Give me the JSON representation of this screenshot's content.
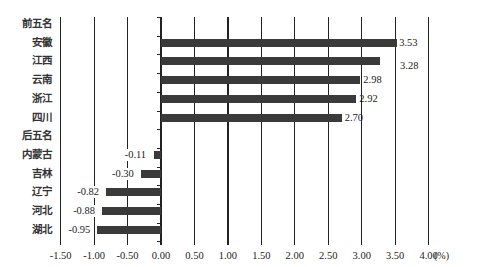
{
  "chart_data": {
    "type": "bar",
    "orientation": "horizontal",
    "title": "",
    "xlabel": "",
    "x_unit": "(%)",
    "ylabel": "",
    "xlim": [
      -1.5,
      4.0
    ],
    "xticks": [
      "-1.50",
      "-1.00",
      "-0.50",
      "0.00",
      "0.50",
      "1.00",
      "1.50",
      "2.00",
      "2.50",
      "3.00",
      "3.50",
      "4.00"
    ],
    "grid": "vertical",
    "legend": null,
    "groups": [
      {
        "name": "前五名",
        "categories": [
          "安徽",
          "江西",
          "云南",
          "浙江",
          "四川"
        ],
        "values": [
          3.53,
          3.28,
          2.98,
          2.92,
          2.7
        ]
      },
      {
        "name": "后五名",
        "categories": [
          "内蒙古",
          "吉林",
          "辽宁",
          "河北",
          "湖北"
        ],
        "values": [
          -0.11,
          -0.3,
          -0.82,
          -0.88,
          -0.95
        ]
      }
    ],
    "categories": [
      "前五名",
      "安徽",
      "江西",
      "云南",
      "浙江",
      "四川",
      "后五名",
      "内蒙古",
      "吉林",
      "辽宁",
      "河北",
      "湖北"
    ],
    "values": [
      null,
      3.53,
      3.28,
      2.98,
      2.92,
      2.7,
      null,
      -0.11,
      -0.3,
      -0.82,
      -0.88,
      -0.95
    ],
    "value_labels": [
      "",
      "3.53",
      "3.28",
      "2.98",
      "2.92",
      "2.70",
      "",
      "-0.11",
      "-0.30",
      "-0.82",
      "-0.88",
      "-0.95"
    ],
    "bar_color": "#3a3a3a"
  }
}
